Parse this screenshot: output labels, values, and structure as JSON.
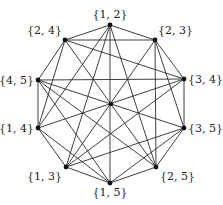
{
  "diagram": {
    "type": "graph",
    "vertices": [
      {
        "id": "12",
        "label": "{1, 2}",
        "x": 110,
        "y": 25,
        "lx": 110,
        "ly": 18,
        "anchor": "middle"
      },
      {
        "id": "23",
        "label": "{2, 3}",
        "x": 155,
        "y": 40,
        "lx": 158,
        "ly": 34,
        "anchor": "start"
      },
      {
        "id": "34",
        "label": "{3, 4}",
        "x": 184,
        "y": 79,
        "lx": 188,
        "ly": 83,
        "anchor": "start"
      },
      {
        "id": "35",
        "label": "{3, 5}",
        "x": 184,
        "y": 128,
        "lx": 188,
        "ly": 132,
        "anchor": "start"
      },
      {
        "id": "25",
        "label": "{2, 5}",
        "x": 156,
        "y": 167,
        "lx": 160,
        "ly": 180,
        "anchor": "start"
      },
      {
        "id": "15",
        "label": "{1, 5}",
        "x": 110,
        "y": 183,
        "lx": 110,
        "ly": 196,
        "anchor": "middle"
      },
      {
        "id": "13",
        "label": "{1, 3}",
        "x": 66,
        "y": 167,
        "lx": 62,
        "ly": 180,
        "anchor": "end"
      },
      {
        "id": "14",
        "label": "{1, 4}",
        "x": 38,
        "y": 128,
        "lx": 34,
        "ly": 132,
        "anchor": "end"
      },
      {
        "id": "45",
        "label": "{4, 5}",
        "x": 38,
        "y": 80,
        "lx": 34,
        "ly": 84,
        "anchor": "end"
      },
      {
        "id": "24",
        "label": "{2, 4}",
        "x": 65,
        "y": 40,
        "lx": 62,
        "ly": 34,
        "anchor": "end"
      }
    ],
    "center_point": {
      "x": 111,
      "y": 104
    },
    "edges": [
      [
        "12",
        "13"
      ],
      [
        "12",
        "14"
      ],
      [
        "12",
        "15"
      ],
      [
        "12",
        "23"
      ],
      [
        "12",
        "24"
      ],
      [
        "12",
        "25"
      ],
      [
        "13",
        "14"
      ],
      [
        "13",
        "15"
      ],
      [
        "13",
        "23"
      ],
      [
        "13",
        "34"
      ],
      [
        "13",
        "35"
      ],
      [
        "14",
        "15"
      ],
      [
        "14",
        "24"
      ],
      [
        "14",
        "34"
      ],
      [
        "14",
        "45"
      ],
      [
        "15",
        "25"
      ],
      [
        "15",
        "35"
      ],
      [
        "15",
        "45"
      ],
      [
        "23",
        "24"
      ],
      [
        "23",
        "25"
      ],
      [
        "23",
        "34"
      ],
      [
        "23",
        "35"
      ],
      [
        "24",
        "25"
      ],
      [
        "24",
        "34"
      ],
      [
        "24",
        "45"
      ],
      [
        "25",
        "35"
      ],
      [
        "25",
        "45"
      ],
      [
        "34",
        "35"
      ],
      [
        "34",
        "45"
      ],
      [
        "35",
        "45"
      ]
    ]
  }
}
